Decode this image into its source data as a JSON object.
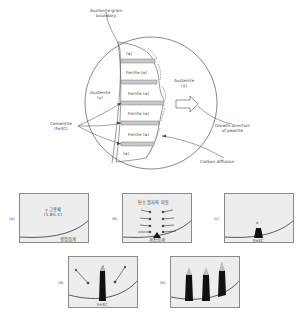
{
  "top_diagram": {
    "labels": {
      "grain_boundary": [
        "Austenite grain",
        "boundary"
      ],
      "austenite_left": [
        "Austenite",
        "(γ)"
      ],
      "austenite_right": [
        "Austenite",
        "(γ)"
      ],
      "cementite": [
        "Cementite",
        "(Fe3C)"
      ],
      "growth_direction": [
        "Growth direction",
        "of pearlite"
      ],
      "carbon_diffusion": "Carbon diffusion"
    },
    "lamellae": [
      {
        "label": "(α)"
      },
      {
        "label": "Ferrite (α)"
      },
      {
        "label": "Ferrite (α)"
      },
      {
        "label": "Ferrite (α)"
      },
      {
        "label": "Ferrite (α)"
      },
      {
        "label": "(α)"
      }
    ]
  },
  "panels": [
    {
      "id": "a",
      "label": "(a)",
      "texts": [
        "γ 고용체",
        "(1.8% C)"
      ],
      "bottom_text": "결정립계"
    },
    {
      "id": "b",
      "label": "(b)",
      "texts": [
        "탄소 원자의 이동"
      ],
      "bottom_text": "결정립계"
    },
    {
      "id": "c",
      "label": "(c)",
      "nucleus_label": "Fe3C",
      "top_mark": "α"
    },
    {
      "id": "d",
      "label": "(d)",
      "nucleus_label": "Fe3C"
    },
    {
      "id": "e",
      "label": "(e)"
    }
  ]
}
